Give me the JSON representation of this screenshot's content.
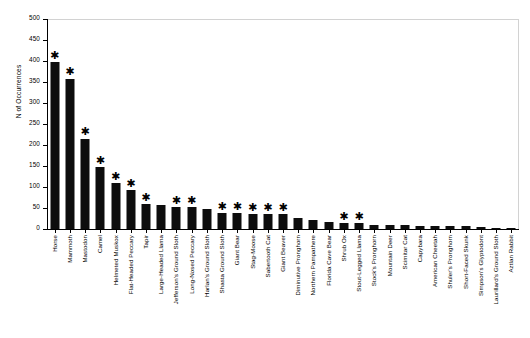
{
  "chart_data": {
    "type": "bar",
    "title": "",
    "xlabel": "",
    "ylabel": "N of Occurrences",
    "ylim": [
      0,
      500
    ],
    "yticks": [
      0,
      50,
      100,
      150,
      200,
      250,
      300,
      350,
      400,
      450,
      500
    ],
    "grid": false,
    "legend": null,
    "bar_color": "#0d0d0d",
    "annotation_symbol": "✱",
    "annotation_meaning": "asterisk marks species",
    "categories": [
      "Horse",
      "Mammoth",
      "Mastodon",
      "Camel",
      "Helmeted Muskox",
      "Flat-Headed Peccary",
      "Tapir",
      "Large-Headed Llama",
      "Jefferson's Ground Sloth",
      "Long-Nosed Peccary",
      "Harlan's Ground Sloth",
      "Shasta Ground Sloth",
      "Giant Bear",
      "Stag-Moose",
      "Sabertooth Cat",
      "Giant Beaver",
      "Diminutive Pronghorn",
      "Northern Pampathere",
      "Florida Cave Bear",
      "Shrub Ox",
      "Stout-Legged Llama",
      "Stock's Pronghorn",
      "Mountain Deer",
      "Scimitar Cat",
      "Capybara",
      "American Cheetah",
      "Shuler's Pronghorn",
      "Short-Faced Skunk",
      "Simpson's Glyptodont",
      "Laurillard's Ground Sloth",
      "Aztlan Rabbit"
    ],
    "values": [
      397,
      358,
      215,
      147,
      109,
      92,
      59,
      57,
      52,
      52,
      47,
      38,
      38,
      35,
      35,
      35,
      27,
      22,
      16,
      14,
      14,
      10,
      10,
      9,
      8,
      8,
      7,
      6,
      5,
      3,
      2
    ],
    "starred": [
      true,
      true,
      true,
      true,
      true,
      true,
      true,
      false,
      true,
      true,
      false,
      true,
      true,
      true,
      true,
      true,
      false,
      false,
      false,
      true,
      true,
      false,
      false,
      false,
      false,
      false,
      false,
      false,
      false,
      false,
      false
    ]
  }
}
